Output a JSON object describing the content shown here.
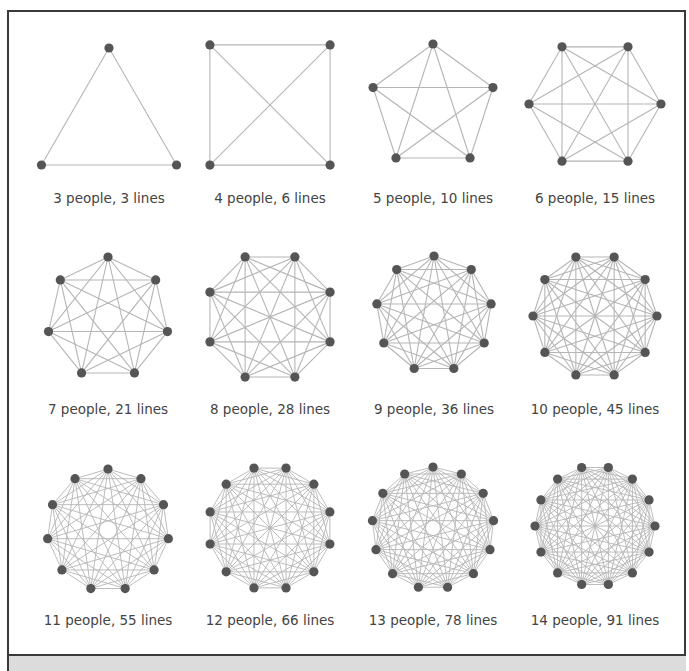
{
  "figure": {
    "colors": {
      "node": "#555555",
      "edge": "#b5b5b5",
      "label": "#444444",
      "border": "#3a3a3a",
      "strip": "#dcdcdc"
    },
    "graphs": [
      {
        "people": 3,
        "lines": 3,
        "label": "3 people, 3 lines",
        "cx": 109,
        "cy": 126,
        "r": 78,
        "rot": -90,
        "labelY": 190
      },
      {
        "people": 4,
        "lines": 6,
        "label": "4 people, 6 lines",
        "cx": 270,
        "cy": 105,
        "r": 85,
        "rot": -135,
        "labelY": 190
      },
      {
        "people": 5,
        "lines": 10,
        "label": "5 people, 10 lines",
        "cx": 433,
        "cy": 107,
        "r": 63,
        "rot": -90,
        "labelY": 190
      },
      {
        "people": 6,
        "lines": 15,
        "label": "6 people, 15 lines",
        "cx": 595,
        "cy": 104,
        "r": 66,
        "rot": -120,
        "labelY": 190
      },
      {
        "people": 7,
        "lines": 21,
        "label": "7 people, 21 lines",
        "cx": 108,
        "cy": 318,
        "r": 61,
        "rot": -90,
        "labelY": 401
      },
      {
        "people": 8,
        "lines": 28,
        "label": "8 people, 28 lines",
        "cx": 270,
        "cy": 317,
        "r": 65,
        "rot": -112.5,
        "labelY": 401
      },
      {
        "people": 9,
        "lines": 36,
        "label": "9 people, 36 lines",
        "cx": 434,
        "cy": 314,
        "r": 58,
        "rot": -90,
        "labelY": 401
      },
      {
        "people": 10,
        "lines": 45,
        "label": "10 people, 45 lines",
        "cx": 595,
        "cy": 316,
        "r": 62,
        "rot": -108,
        "labelY": 401
      },
      {
        "people": 11,
        "lines": 55,
        "label": "11 people, 55 lines",
        "cx": 108,
        "cy": 530,
        "r": 61,
        "rot": -90,
        "labelY": 612
      },
      {
        "people": 12,
        "lines": 66,
        "label": "12 people, 66 lines",
        "cx": 270,
        "cy": 528,
        "r": 62,
        "rot": -105,
        "labelY": 612
      },
      {
        "people": 13,
        "lines": 78,
        "label": "13 people, 78 lines",
        "cx": 433,
        "cy": 528,
        "r": 61,
        "rot": -90,
        "labelY": 612
      },
      {
        "people": 14,
        "lines": 91,
        "label": "14 people, 91 lines",
        "cx": 595,
        "cy": 526,
        "r": 60,
        "rot": -102.857,
        "labelY": 612
      }
    ]
  },
  "chart_data": {
    "type": "diagram",
    "title": "",
    "categories": [
      "3",
      "4",
      "5",
      "6",
      "7",
      "8",
      "9",
      "10",
      "11",
      "12",
      "13",
      "14"
    ],
    "series": [
      {
        "name": "people",
        "values": [
          3,
          4,
          5,
          6,
          7,
          8,
          9,
          10,
          11,
          12,
          13,
          14
        ]
      },
      {
        "name": "lines",
        "values": [
          3,
          6,
          10,
          15,
          21,
          28,
          36,
          45,
          55,
          66,
          78,
          91
        ]
      }
    ],
    "layout": {
      "grid": "4 columns x 3 rows"
    }
  }
}
